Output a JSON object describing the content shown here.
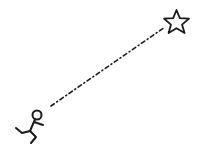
{
  "scene": {
    "description": "Stick figure running toward a star along a dashed path",
    "elements": [
      {
        "name": "stick-figure",
        "icon": "running-person-icon"
      },
      {
        "name": "dashed-path",
        "style": "dash-dot"
      },
      {
        "name": "star",
        "icon": "star-outline-icon"
      }
    ],
    "colors": {
      "stroke": "#1a1a1a",
      "background": "#ffffff"
    }
  }
}
